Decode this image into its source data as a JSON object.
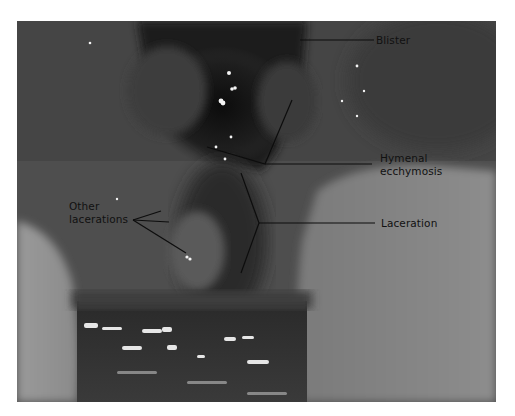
{
  "figure": {
    "type": "annotated clinical photograph (grayscale)",
    "annotations": [
      {
        "id": "blister",
        "lines": [
          "Blister"
        ]
      },
      {
        "id": "hymenal-ecchymosis",
        "lines": [
          "Hymenal",
          "ecchymosis"
        ]
      },
      {
        "id": "laceration",
        "lines": [
          "Laceration"
        ]
      },
      {
        "id": "other-lacerations",
        "lines": [
          "Other",
          "lacerations"
        ]
      }
    ],
    "colors": {
      "page_background": "#ffffff",
      "label_text": "#111111",
      "leader_line": "#0d0d0d",
      "photo_midtone": "#5a5a5a",
      "photo_dark": "#1c1c1c",
      "photo_light": "#9a9a9a"
    }
  }
}
